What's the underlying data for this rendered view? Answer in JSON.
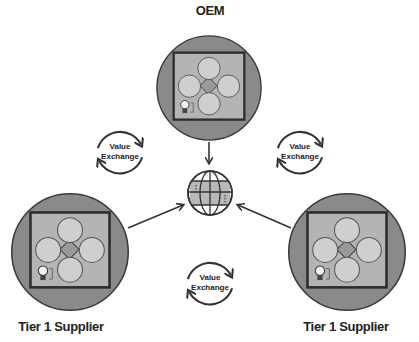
{
  "diagram": {
    "type": "ecosystem value exchange",
    "nodes": {
      "oem": {
        "label": "OEM",
        "inner": {
          "top": "Business Dev",
          "right": "CVC",
          "bottom": "Startup R&D",
          "left": "Strategy & Corp Dev"
        }
      },
      "supplier_left": {
        "label": "Tier 1 Supplier",
        "inner": {
          "top": "Business Dev",
          "right": "CVC",
          "bottom": "Startup R&D",
          "left": "Strategy & Corp Dev"
        }
      },
      "supplier_right": {
        "label": "Tier 1 Supplier",
        "inner": {
          "top": "Business Dev",
          "right": "CVC",
          "bottom": "Startup R&D",
          "left": "Strategy & Corp Dev"
        }
      },
      "center": {
        "icon": "globe-icon"
      }
    },
    "exchanges": [
      {
        "line1": "Value",
        "line2": "Exchange",
        "between": "OEM - Tier 1 Supplier (left)"
      },
      {
        "line1": "Value",
        "line2": "Exchange",
        "between": "OEM - Tier 1 Supplier (right)"
      },
      {
        "line1": "Value",
        "line2": "Exchange",
        "between": "Tier 1 Supplier - Tier 1 Supplier"
      }
    ],
    "edges": [
      {
        "from": "OEM",
        "to": "globe"
      },
      {
        "from": "Tier 1 Supplier (left)",
        "to": "globe"
      },
      {
        "from": "Tier 1 Supplier (right)",
        "to": "globe"
      }
    ],
    "colors": {
      "circle_fill": "#8a8a8a",
      "circle_stroke": "#444444",
      "square_fill": "#b4b4b4",
      "square_stroke": "#333333",
      "inner_circle_fill": "#cfcfcf",
      "diamond_fill": "#9a9a9a",
      "globe_fill": "#b8b8b8",
      "line": "#333333"
    }
  }
}
